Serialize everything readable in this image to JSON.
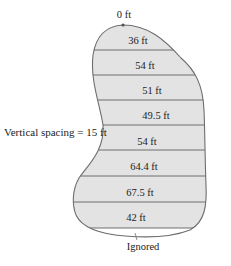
{
  "diagram": {
    "top_label": "0 ft",
    "side_label": "Vertical spacing = 15 ft",
    "bottom_label": "Ignored",
    "widths": [
      "36 ft",
      "54 ft",
      "51 ft",
      "49.5 ft",
      "54 ft",
      "64.4 ft",
      "67.5 ft",
      "42 ft"
    ],
    "colors": {
      "fill": "#e3e3e3",
      "stroke": "#6e6e6e"
    }
  }
}
